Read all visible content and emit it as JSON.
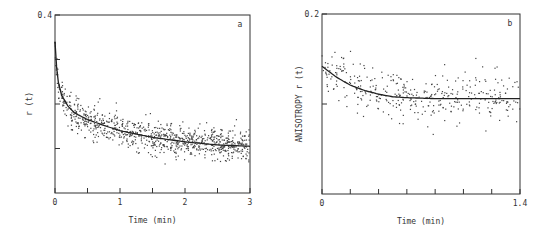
{
  "chart_data": [
    {
      "type": "scatter",
      "panel_label": "a",
      "title": "",
      "xlabel": "Time (min)",
      "ylabel": "r (t)",
      "xlim": [
        0,
        3
      ],
      "ylim": [
        0,
        0.4
      ],
      "x_tick_labels": [
        "0",
        "1",
        "2",
        "3"
      ],
      "x_ticks": [
        0,
        0.5,
        1,
        1.5,
        2,
        2.5,
        3
      ],
      "y_tick_labels": [
        "0.4"
      ],
      "y_ticks": [
        0.1,
        0.2,
        0.3,
        0.4
      ],
      "grid": false,
      "series": [
        {
          "name": "fit",
          "kind": "line",
          "x": [
            0,
            0.02,
            0.05,
            0.1,
            0.2,
            0.3,
            0.5,
            0.75,
            1.0,
            1.5,
            2.0,
            2.5,
            3.0
          ],
          "y": [
            0.34,
            0.29,
            0.25,
            0.22,
            0.195,
            0.18,
            0.165,
            0.152,
            0.14,
            0.125,
            0.115,
            0.108,
            0.105
          ]
        },
        {
          "name": "data",
          "kind": "scatter",
          "note": "noisy points scattered around fit, spread approx ±0.03"
        }
      ]
    },
    {
      "type": "scatter",
      "panel_label": "b",
      "title": "",
      "xlabel": "Time (min)",
      "ylabel": "ANISOTROPY r (t)",
      "xlim": [
        0,
        1.4
      ],
      "ylim": [
        0,
        0.2
      ],
      "x_tick_labels": [
        "0",
        "1.4"
      ],
      "x_ticks": [
        0,
        0.2,
        0.4,
        0.6,
        0.8,
        1.0,
        1.2,
        1.4
      ],
      "y_tick_labels": [
        "0.2"
      ],
      "y_ticks": [
        0.1,
        0.2
      ],
      "grid": false,
      "series": [
        {
          "name": "fit",
          "kind": "line",
          "x": [
            0,
            0.1,
            0.2,
            0.3,
            0.4,
            0.5,
            0.6,
            0.8,
            1.0,
            1.2,
            1.4
          ],
          "y": [
            0.142,
            0.13,
            0.121,
            0.115,
            0.111,
            0.108,
            0.107,
            0.106,
            0.106,
            0.106,
            0.106
          ]
        },
        {
          "name": "data",
          "kind": "scatter",
          "note": "sparse noisy points around fit, spread approx ±0.025"
        }
      ]
    }
  ]
}
